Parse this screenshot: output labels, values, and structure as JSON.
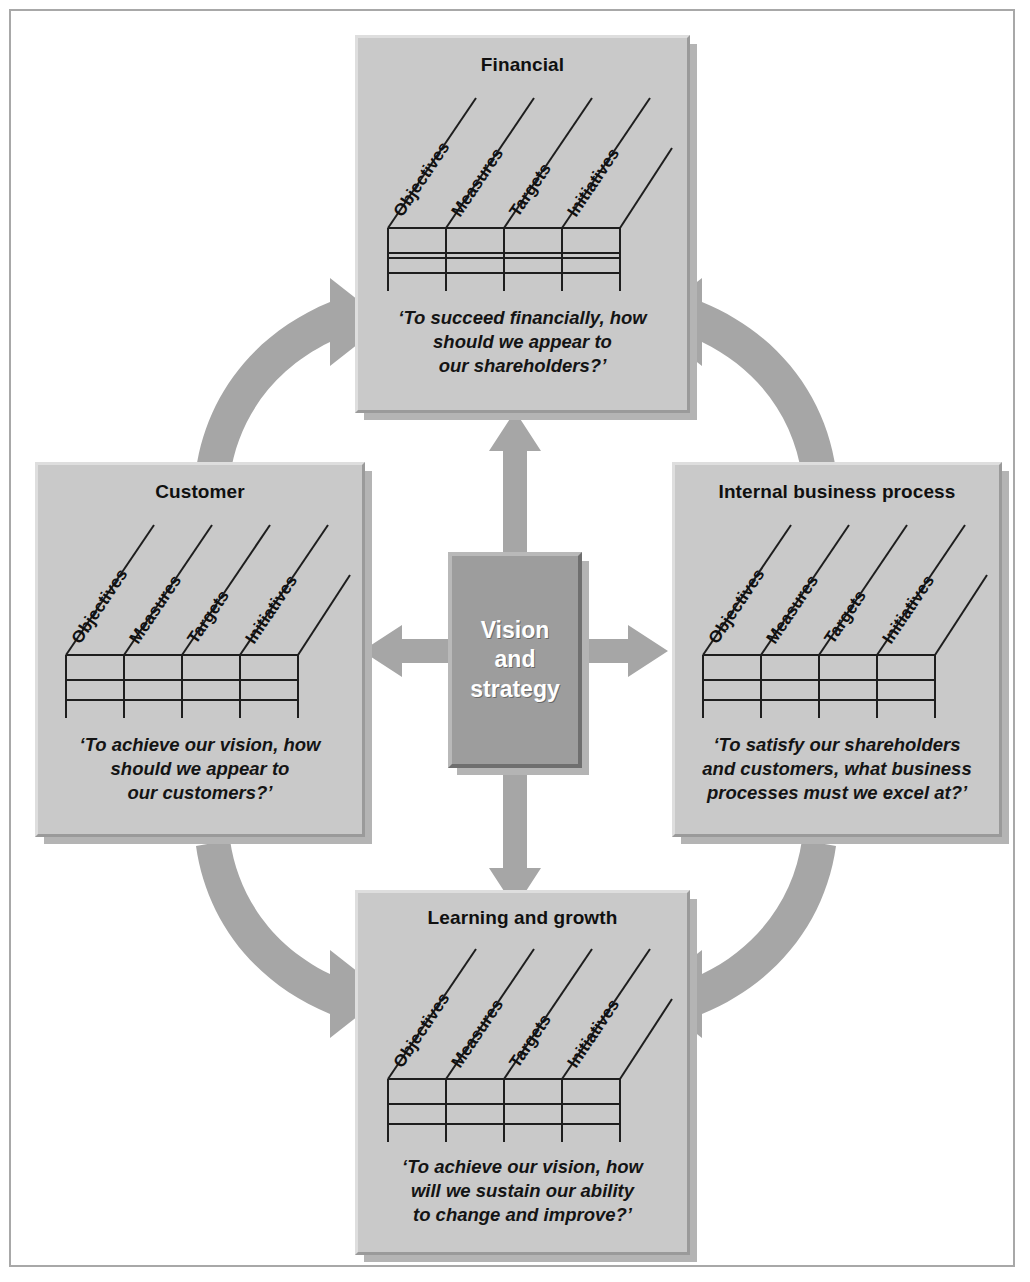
{
  "diagram": {
    "center": {
      "label": "Vision and strategy",
      "line1": "Vision",
      "line2": "and",
      "line3": "strategy",
      "fill": "#9d9d9d",
      "text_color": "#ffffff"
    },
    "column_headers": [
      "Objectives",
      "Measures",
      "Targets",
      "Initiatives"
    ],
    "grid": {
      "columns": 4,
      "rows": 4
    },
    "panel_fill": "#c9c9c9",
    "arrow_fill": "#a6a6a6",
    "border_color": "#a8a8a8",
    "perspectives": [
      {
        "id": "financial",
        "title": "Financial",
        "quote_lines": [
          "‘To succeed financially, how",
          "should we appear to",
          "our shareholders?’"
        ],
        "quote": "‘To succeed financially, how should we appear to our shareholders?’"
      },
      {
        "id": "customer",
        "title": "Customer",
        "quote_lines": [
          "‘To achieve our vision, how",
          "should we appear to",
          "our customers?’"
        ],
        "quote": "‘To achieve our vision, how should we appear to our customers?’"
      },
      {
        "id": "internal-business-process",
        "title": "Internal business process",
        "quote_lines": [
          "‘To satisfy our shareholders",
          "and customers, what business",
          "processes must we excel at?’"
        ],
        "quote": "‘To satisfy our shareholders and customers, what business processes must we excel at?’"
      },
      {
        "id": "learning-and-growth",
        "title": "Learning and growth",
        "quote_lines": [
          "‘To achieve our vision, how",
          "will we sustain our ability",
          "to change and improve?’"
        ],
        "quote": "‘To achieve our vision, how will we sustain our ability to change and improve?’"
      }
    ],
    "connectors": [
      {
        "name": "customer-to-financial",
        "type": "curved-arrow",
        "heads": "single"
      },
      {
        "name": "financial-to-internal-business-process",
        "type": "curved-arrow",
        "heads": "single"
      },
      {
        "name": "customer-to-learning-and-growth",
        "type": "curved-arrow",
        "heads": "single"
      },
      {
        "name": "internal-business-process-to-learning-and-growth",
        "type": "curved-arrow",
        "heads": "single"
      },
      {
        "name": "vision-to-financial",
        "type": "straight-arrow",
        "heads": "single"
      },
      {
        "name": "vision-to-customer",
        "type": "straight-arrow",
        "heads": "single"
      },
      {
        "name": "vision-to-internal-business-process",
        "type": "straight-arrow",
        "heads": "single"
      },
      {
        "name": "vision-to-learning-and-growth",
        "type": "straight-arrow",
        "heads": "single"
      }
    ]
  }
}
